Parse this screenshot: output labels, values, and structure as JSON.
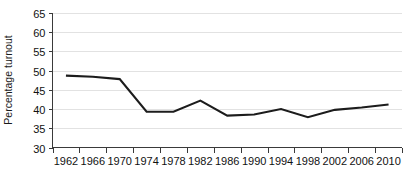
{
  "chart_data": {
    "type": "line",
    "title": "",
    "subtitle": "",
    "xlabel": "",
    "ylabel": "Percentage turnout",
    "x": [
      1962,
      1966,
      1970,
      1974,
      1978,
      1982,
      1986,
      1990,
      1994,
      1998,
      2002,
      2006,
      2010
    ],
    "categories": [
      "1962",
      "1966",
      "1970",
      "1974",
      "1978",
      "1982",
      "1986",
      "1990",
      "1994",
      "1998",
      "2002",
      "2006",
      "2010"
    ],
    "values": [
      48.7,
      48.4,
      47.8,
      39.3,
      39.3,
      42.2,
      38.3,
      38.6,
      40.0,
      37.9,
      39.8,
      40.4,
      41.2
    ],
    "series": [
      {
        "name": "Percentage turnout",
        "color": "#1c1c1c",
        "values": [
          48.7,
          48.4,
          47.8,
          39.3,
          39.3,
          42.2,
          38.3,
          38.6,
          40.0,
          37.9,
          39.8,
          40.4,
          41.2
        ]
      }
    ],
    "xlim": [
      1960,
      2012
    ],
    "ylim": [
      30,
      65
    ],
    "y_ticks": [
      30,
      35,
      40,
      45,
      50,
      55,
      60,
      65
    ],
    "y_tick_labels": [
      "30",
      "35",
      "40",
      "45",
      "50",
      "55",
      "60",
      "65"
    ],
    "x_tick_labels": [
      "1962",
      "1966",
      "1970",
      "1974",
      "1978",
      "1982",
      "1986",
      "1990",
      "1994",
      "1998",
      "2002",
      "2006",
      "2010"
    ],
    "grid": "horizontal",
    "legend": "none",
    "annotations": []
  },
  "axes": {
    "y_axis_title": "Percentage turnout"
  },
  "colors": {
    "line": "#1c1c1c",
    "grid": "#e2e2e2",
    "axis": "#3a3a3a",
    "background": "#ffffff",
    "text": "#111111"
  }
}
